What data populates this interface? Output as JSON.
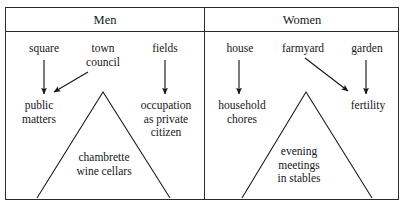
{
  "figure": {
    "type": "two-column-comparison-diagram",
    "scan_artifact_text": "·"
  },
  "columns": [
    {
      "id": "men",
      "header": "Men",
      "top_nodes": [
        {
          "id": "square",
          "label": "square"
        },
        {
          "id": "town-council",
          "label": "town\ncouncil"
        },
        {
          "id": "fields",
          "label": "fields"
        }
      ],
      "bottom_nodes": [
        {
          "id": "public-matters",
          "label": "public\nmatters"
        },
        {
          "id": "occupation",
          "label": "occupation\nas private\ncitizen"
        }
      ],
      "tent_label": "chambrette\nwine cellars",
      "arrows": [
        {
          "from": "square",
          "to": "public-matters",
          "direction": "down"
        },
        {
          "from": "town-council",
          "to": "public-matters",
          "direction": "down-left"
        },
        {
          "from": "fields",
          "to": "occupation",
          "direction": "down"
        }
      ]
    },
    {
      "id": "women",
      "header": "Women",
      "top_nodes": [
        {
          "id": "house",
          "label": "house"
        },
        {
          "id": "farmyard",
          "label": "farmyard"
        },
        {
          "id": "garden",
          "label": "garden"
        }
      ],
      "bottom_nodes": [
        {
          "id": "household-chores",
          "label": "household\nchores"
        },
        {
          "id": "fertility",
          "label": "fertility"
        }
      ],
      "tent_label": "evening\nmeetings\nin stables",
      "arrows": [
        {
          "from": "house",
          "to": "household-chores",
          "direction": "down"
        },
        {
          "from": "farmyard",
          "to": "fertility",
          "direction": "down-right"
        },
        {
          "from": "garden",
          "to": "fertility",
          "direction": "down"
        }
      ]
    }
  ],
  "labels": {
    "men_header": "Men",
    "women_header": "Women",
    "square": "square",
    "town_council_line1": "town",
    "town_council_line2": "council",
    "fields": "fields",
    "public_matters_line1": "public",
    "public_matters_line2": "matters",
    "occupation_line1": "occupation",
    "occupation_line2": "as private",
    "occupation_line3": "citizen",
    "chambrette_line1": "chambrette",
    "chambrette_line2": "wine cellars",
    "house": "house",
    "farmyard": "farmyard",
    "garden": "garden",
    "household_line1": "household",
    "household_line2": "chores",
    "fertility": "fertility",
    "evening_line1": "evening",
    "evening_line2": "meetings",
    "evening_line3": "in stables"
  },
  "colors": {
    "ink": "#17171a",
    "rule": "#2b2b2e",
    "paper": "#ffffff",
    "sliver": "#c9c9cc"
  }
}
